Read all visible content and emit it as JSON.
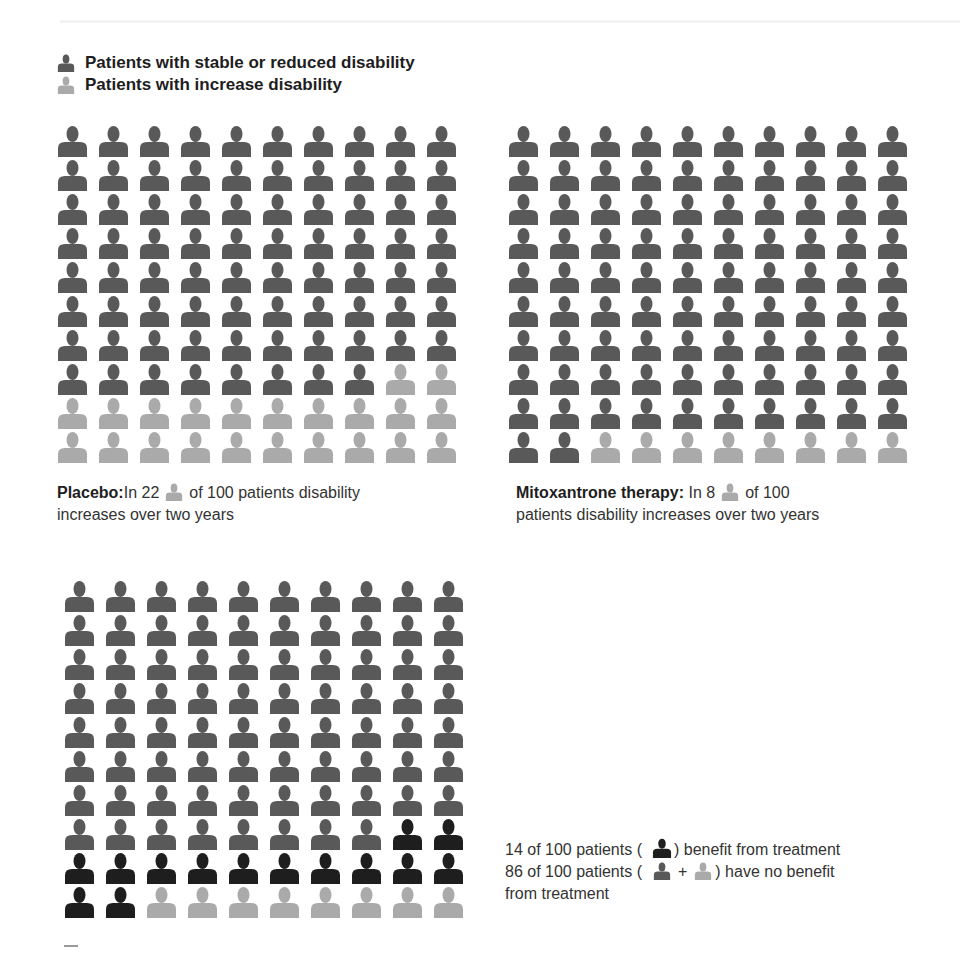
{
  "colors": {
    "stable": "#595959",
    "increase": "#aaaaaa",
    "benefit": "#1e1e1e"
  },
  "legend": {
    "stable_label": "Patients with stable or reduced disability",
    "increase_label": "Patients with increase disability"
  },
  "captions": {
    "placebo": {
      "bold": "Placebo:",
      "pre": "In 22",
      "post": "of 100 patients disability",
      "line2": "increases over two years"
    },
    "mitoxantrone": {
      "bold": "Mitoxantrone therapy:",
      "pre": "In 8",
      "post": "of 100",
      "line2": "patients disability increases over two years"
    },
    "benefit": {
      "line1_pre": "14 of 100 patients (",
      "line1_post": ") benefit from treatment",
      "line2_pre": "86 of 100 patients (",
      "line2_plus": "+",
      "line2_post": ") have no benefit",
      "line3": "from treatment"
    }
  },
  "chart_data": [
    {
      "type": "pictogram",
      "title": "Placebo",
      "rows": 10,
      "cols": 10,
      "fill_order": "row-major",
      "series": [
        {
          "name": "Patients with stable or reduced disability",
          "key": "stable",
          "count": 78
        },
        {
          "name": "Patients with increase disability",
          "key": "increase",
          "count": 22
        }
      ]
    },
    {
      "type": "pictogram",
      "title": "Mitoxantrone therapy",
      "rows": 10,
      "cols": 10,
      "fill_order": "row-major",
      "series": [
        {
          "name": "Patients with stable or reduced disability",
          "key": "stable",
          "count": 92
        },
        {
          "name": "Patients with increase disability",
          "key": "increase",
          "count": 8
        }
      ]
    },
    {
      "type": "pictogram",
      "title": "Benefit from treatment",
      "rows": 10,
      "cols": 10,
      "fill_order": "row-major",
      "series": [
        {
          "name": "No benefit (stable regardless)",
          "key": "stable",
          "count": 78
        },
        {
          "name": "Benefit from treatment",
          "key": "benefit",
          "count": 14
        },
        {
          "name": "No benefit (increase disability)",
          "key": "increase",
          "count": 8
        }
      ]
    }
  ]
}
